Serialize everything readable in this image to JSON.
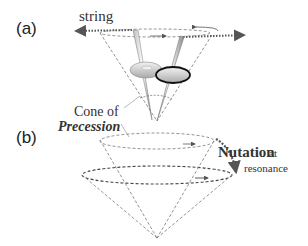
{
  "panels": {
    "a": {
      "label": "(a)",
      "string_label": "string",
      "cone_label_line1": "Cone of",
      "cone_label_line2": "Precession"
    },
    "b": {
      "label": "(b)",
      "nutation_word": "Nutation",
      "nutation_at": "at",
      "nutation_resonance": "resonance"
    }
  },
  "colors": {
    "line": "#555555",
    "dashed": "#777777",
    "text": "#333333",
    "italic_text": "#666666"
  }
}
